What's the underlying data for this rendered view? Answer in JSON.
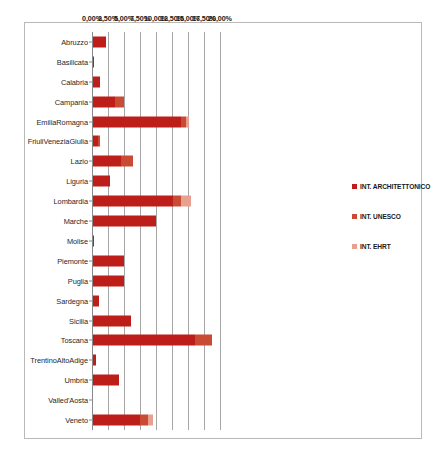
{
  "chart_data": {
    "type": "bar",
    "orientation": "horizontal",
    "title": "",
    "xlabel": "",
    "ylabel": "",
    "xlim": [
      0,
      20
    ],
    "xticks": [
      "0,00%",
      "2,50%",
      "5,00%",
      "7,50%",
      "10,00%",
      "12,50%",
      "15,00%",
      "17,50%",
      "20,00%"
    ],
    "xtick_values": [
      0,
      2.5,
      5,
      7.5,
      10,
      12.5,
      15,
      17.5,
      20
    ],
    "grid": true,
    "axis_position": "top",
    "stacked": true,
    "legend_position": "right",
    "categories": [
      "Abruzzo",
      "Basilicata",
      "Calabria",
      "Campania",
      "EmiliaRomagna",
      "FriuliVeneziaGiulia",
      "Lazio",
      "Liguria",
      "Lombardia",
      "Marche",
      "Molise",
      "Piemonte",
      "Puglia",
      "Sardegna",
      "Sicilia",
      "Toscana",
      "TrentinoAltoAdige",
      "Umbria",
      "Valled'Aosta",
      "Veneto"
    ],
    "series": [
      {
        "name": "INT. ARCHITETTONICO",
        "color": "#BE1E19",
        "values": [
          2.0,
          0.2,
          1.1,
          3.5,
          13.8,
          0.85,
          4.3,
          2.6,
          12.5,
          9.9,
          0.15,
          4.8,
          4.9,
          1.0,
          6.0,
          16.0,
          0.5,
          4.0,
          0.0,
          7.3
        ]
      },
      {
        "name": "INT. UNESCO",
        "color": "#C84B34",
        "values": [
          0.0,
          0.0,
          0.0,
          1.4,
          0.7,
          0.3,
          2.0,
          0.0,
          1.2,
          0.0,
          0.0,
          0.0,
          0.0,
          0.0,
          0.0,
          2.6,
          0.0,
          0.0,
          0.0,
          1.3
        ]
      },
      {
        "name": "INT. EHRT",
        "color": "#E8A090",
        "values": [
          0.0,
          0.0,
          0.0,
          0.0,
          0.5,
          0.0,
          0.0,
          0.0,
          1.6,
          0.0,
          0.0,
          0.0,
          0.0,
          0.0,
          0.0,
          0.0,
          0.0,
          0.0,
          0.0,
          0.7
        ]
      }
    ]
  },
  "legend": {
    "items": [
      {
        "label": "INT. ARCHITETTONICO",
        "color": "#BE1E19"
      },
      {
        "label": "INT. UNESCO",
        "color": "#C84B34"
      },
      {
        "label": "INT. EHRT",
        "color": "#E8A090"
      }
    ]
  }
}
